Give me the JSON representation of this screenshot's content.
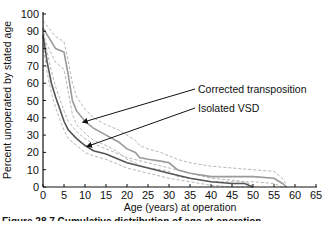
{
  "chart_data": {
    "type": "line",
    "title": "",
    "xlabel": "Age (years) at operation",
    "ylabel": "Percent unoperated by stated age",
    "xlim": [
      0,
      65
    ],
    "ylim": [
      0,
      100
    ],
    "x_ticks": [
      0,
      5,
      10,
      15,
      20,
      25,
      30,
      35,
      40,
      45,
      50,
      55,
      60,
      65
    ],
    "y_ticks": [
      0,
      10,
      20,
      30,
      40,
      50,
      60,
      70,
      80,
      90,
      100
    ],
    "grid": false,
    "legend": "annotations with arrows",
    "series": [
      {
        "name": "Corrected transposition",
        "color": "#9a9a9a",
        "x": [
          0,
          1,
          3,
          5,
          6,
          7,
          8,
          10,
          12,
          15,
          18,
          20,
          22,
          23,
          25,
          28,
          30,
          32,
          35,
          40,
          45,
          50,
          55,
          57,
          58
        ],
        "y": [
          92,
          88,
          80,
          78,
          65,
          50,
          44,
          38,
          34,
          30,
          26,
          22,
          20,
          17,
          16,
          15,
          14,
          10,
          8,
          6,
          6,
          6,
          5,
          2,
          0
        ],
        "ci_upper": [
          96,
          93,
          87,
          84,
          73,
          60,
          52,
          45,
          40,
          36,
          33,
          30,
          27,
          24,
          22,
          20,
          18,
          16,
          14,
          12,
          11,
          10,
          9,
          5,
          1
        ],
        "ci_lower": [
          86,
          82,
          72,
          68,
          55,
          42,
          36,
          31,
          27,
          24,
          20,
          16,
          14,
          12,
          11,
          10,
          9,
          6,
          5,
          3,
          3,
          3,
          2,
          0,
          0
        ]
      },
      {
        "name": "Isolated VSD",
        "color": "#555555",
        "x": [
          0,
          1,
          2,
          3,
          4,
          5,
          6,
          8,
          10,
          12,
          15,
          18,
          20,
          25,
          30,
          35,
          40,
          45,
          48,
          50
        ],
        "y": [
          88,
          72,
          60,
          52,
          45,
          38,
          33,
          28,
          24,
          21,
          19,
          16,
          14,
          11,
          8,
          5,
          3,
          2,
          2,
          0
        ],
        "ci_upper": [
          92,
          78,
          67,
          58,
          51,
          44,
          38,
          32,
          28,
          25,
          22,
          19,
          17,
          14,
          11,
          8,
          5,
          4,
          3,
          1
        ],
        "ci_lower": [
          82,
          66,
          54,
          46,
          39,
          33,
          28,
          24,
          20,
          18,
          16,
          13,
          11,
          8,
          5,
          3,
          1,
          0,
          0,
          0
        ]
      }
    ],
    "annotations": [
      {
        "text": "Corrected transposition",
        "arrow_to": [
          9,
          38
        ]
      },
      {
        "text": "Isolated VSD",
        "arrow_to": [
          10,
          24
        ]
      }
    ]
  },
  "caption": "Figure 28.7 Cumulative distribution of age at operation"
}
